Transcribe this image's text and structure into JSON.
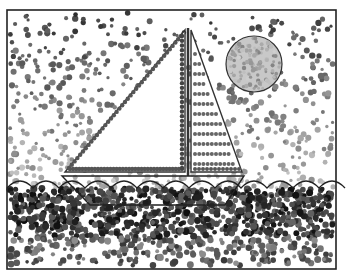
{
  "artwork": {
    "subject": "pointillism sailboat on water with sun",
    "frame": {
      "x": 7,
      "y": 10,
      "w": 329,
      "h": 259,
      "stroke": "#222222"
    },
    "sun": {
      "cx": 254,
      "cy": 64,
      "r": 28,
      "fill": "#c8c8c8",
      "stroke": "#333333"
    },
    "sail_left": {
      "points": "65,172 185,30 185,172",
      "stroke": "#333333"
    },
    "sail_right": {
      "points": "191,30 191,172 242,172",
      "stroke": "#333333"
    },
    "mast": {
      "x1": 188,
      "y1": 28,
      "x2": 188,
      "y2": 176
    },
    "hull": {
      "points": "62,176 244,176 225,205 90,205",
      "stroke": "#222222"
    },
    "waterline_y": 188,
    "colors": {
      "sky_dark": "#2a2a2a",
      "sky_mid": "#777777",
      "sky_light": "#b8b8b8",
      "water_dark": "#1a1a1a",
      "water_mid": "#444444",
      "sail_stripe": "#666666"
    }
  }
}
